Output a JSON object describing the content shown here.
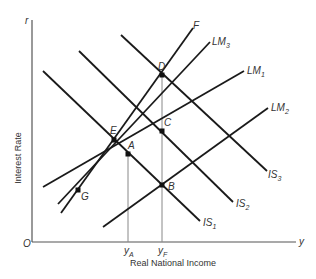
{
  "diagram": {
    "axes": {
      "y_axis_symbol": "r",
      "x_axis_symbol": "y",
      "origin": "O",
      "y_axis_title": "Interest Rate",
      "x_axis_title": "Real National Income",
      "x_ticks": [
        {
          "main": "y",
          "sub": "A"
        },
        {
          "main": "y",
          "sub": "F"
        }
      ]
    },
    "curves": [
      {
        "id": "IS1",
        "main": "IS",
        "sub": "1"
      },
      {
        "id": "IS2",
        "main": "IS",
        "sub": "2"
      },
      {
        "id": "IS3",
        "main": "IS",
        "sub": "3"
      },
      {
        "id": "LM1",
        "main": "LM",
        "sub": "1"
      },
      {
        "id": "LM2",
        "main": "LM",
        "sub": "2"
      },
      {
        "id": "LM3",
        "main": "LM",
        "sub": "3"
      },
      {
        "id": "F",
        "main": "F",
        "sub": ""
      }
    ],
    "points": [
      "A",
      "B",
      "C",
      "D",
      "E",
      "G"
    ],
    "colors": {
      "line": "#1a1a1a",
      "axis": "#555555",
      "guide": "#888888"
    }
  }
}
